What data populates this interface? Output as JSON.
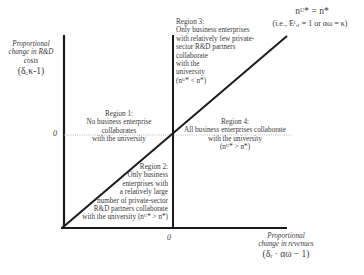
{
  "diagram": {
    "y_axis": {
      "label_lines": [
        "Proportional",
        "change in R&D",
        "costs"
      ],
      "formula": "(δ_c κ-1)",
      "formula_display": "(δ꜀κ-1)",
      "zero_label": "0"
    },
    "x_axis": {
      "label_lines": [
        "Proportional",
        "change in revenues"
      ],
      "formula_display": "(δᵣ · αω − 1)",
      "zero_label": "0"
    },
    "boundary_line": {
      "equation": "nᵁ* = n*",
      "condition": "(i.e., Eᶜ,ᵣ = 1 or αω = κ)"
    },
    "regions": [
      {
        "id": "region-1",
        "lines": [
          "Region 1:",
          "No business enterprise",
          "collaborates",
          "with the university"
        ]
      },
      {
        "id": "region-2",
        "lines": [
          "Region 2:",
          "Only business",
          "enterprises with",
          "a relatively large",
          "number of private-sector",
          "R&D partners collaborate",
          "with the university (nᵁ* > n*)"
        ]
      },
      {
        "id": "region-3",
        "lines": [
          "Region 3:",
          "Only business enterprises",
          "with relatively few private-",
          "sector R&D partners",
          "collaborate",
          "with the",
          "university",
          "(nᵁ* < n*)"
        ]
      },
      {
        "id": "region-4",
        "lines": [
          "Region 4:",
          "All business enterprises collaborate",
          "with the university",
          "(nᵁ* > n*)"
        ]
      }
    ],
    "colors": {
      "axis": "#1a1a1a",
      "text": "#3a3a3a",
      "dotted": "#aaaaaa"
    }
  }
}
